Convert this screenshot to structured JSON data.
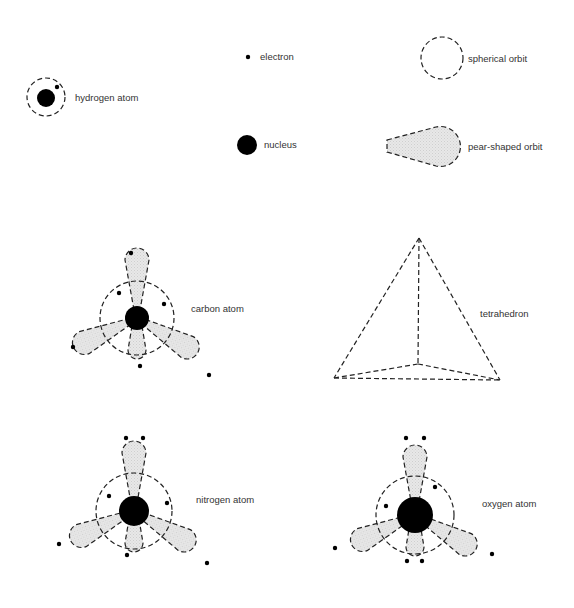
{
  "legend": {
    "hydrogen_atom": "hydrogen atom",
    "electron": "electron",
    "spherical_orbit": "spherical orbit",
    "nucleus": "nucleus",
    "pear_shaped_orbit": "pear-shaped orbit"
  },
  "atoms": {
    "carbon": "carbon atom",
    "tetrahedron": "tetrahedron",
    "nitrogen": "nitrogen atom",
    "oxygen": "oxygen atom"
  },
  "colors": {
    "ink": "#000000",
    "lobe_fill": "#e6e6e6",
    "text": "#333333"
  }
}
